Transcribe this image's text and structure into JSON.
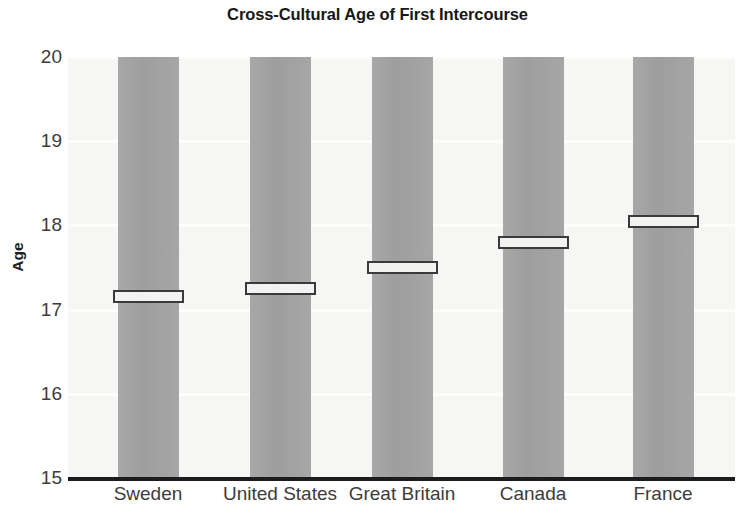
{
  "chart_data": {
    "type": "bar",
    "title": "Cross-Cultural Age of First Intercourse",
    "xlabel": "",
    "ylabel": "Age",
    "categories": [
      "Sweden",
      "United States",
      "Great Britain",
      "Canada",
      "France"
    ],
    "values": [
      17.15,
      17.25,
      17.5,
      17.8,
      18.05
    ],
    "ylim": [
      15,
      20
    ],
    "ytick_labels": [
      "20",
      "19",
      "18",
      "17",
      "16",
      "15"
    ],
    "ytick_values": [
      20,
      19,
      18,
      17,
      16,
      15
    ],
    "grid": true,
    "legend": "none",
    "marker_style": "white-band-with-dark-outline",
    "bar_color": "#a3a3a3",
    "plot_background": "#f6f6f4",
    "axis_color": "#1c1c1c",
    "marker_fill": "#f2f2f0",
    "marker_outline": "#3a3a3a"
  }
}
